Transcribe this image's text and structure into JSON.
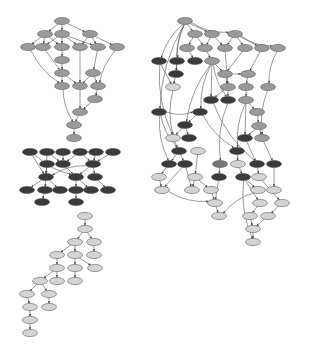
{
  "diagram": {
    "type": "directed-graph",
    "colors": {
      "medium": "#9a9a9a",
      "dark": "#3a3a3a",
      "light": "#d4d4d4",
      "mid2": "#777777",
      "edge": "#555555",
      "stroke": "#444444"
    },
    "node_rx": 7.5,
    "node_ry": 3.6,
    "clusters": [
      {
        "name": "left-top-medium",
        "color": "medium",
        "nodes": [
          [
            62,
            21
          ],
          [
            45,
            34
          ],
          [
            62,
            34
          ],
          [
            90,
            34
          ],
          [
            28,
            47
          ],
          [
            43,
            47
          ],
          [
            62,
            47
          ],
          [
            80,
            47
          ],
          [
            98,
            47
          ],
          [
            117,
            47
          ],
          [
            62,
            60
          ],
          [
            62,
            73
          ],
          [
            93,
            73
          ],
          [
            62,
            86
          ],
          [
            80,
            86
          ],
          [
            98,
            86
          ],
          [
            95,
            99
          ],
          [
            80,
            112
          ],
          [
            74,
            125
          ],
          [
            74,
            138
          ]
        ],
        "edges": [
          [
            0,
            1
          ],
          [
            0,
            2
          ],
          [
            0,
            3
          ],
          [
            1,
            4
          ],
          [
            1,
            5
          ],
          [
            1,
            6
          ],
          [
            2,
            5
          ],
          [
            2,
            6
          ],
          [
            2,
            7
          ],
          [
            2,
            8
          ],
          [
            3,
            7
          ],
          [
            3,
            8
          ],
          [
            3,
            9
          ],
          [
            6,
            10
          ],
          [
            10,
            11
          ],
          [
            4,
            13
          ],
          [
            5,
            11
          ],
          [
            7,
            14
          ],
          [
            8,
            12
          ],
          [
            9,
            15
          ],
          [
            11,
            13
          ],
          [
            11,
            14
          ],
          [
            12,
            14
          ],
          [
            12,
            15
          ],
          [
            15,
            16
          ],
          [
            16,
            17
          ],
          [
            14,
            17
          ],
          [
            13,
            18
          ],
          [
            17,
            18
          ],
          [
            18,
            19
          ]
        ]
      },
      {
        "name": "left-middle-dark",
        "color": "dark",
        "nodes": [
          [
            30,
            152
          ],
          [
            47,
            152
          ],
          [
            63,
            152
          ],
          [
            80,
            152
          ],
          [
            96,
            152
          ],
          [
            113,
            152
          ],
          [
            47,
            164
          ],
          [
            63,
            164
          ],
          [
            93,
            164
          ],
          [
            46,
            177
          ],
          [
            76,
            177
          ],
          [
            95,
            177
          ],
          [
            27,
            190
          ],
          [
            45,
            190
          ],
          [
            60,
            190
          ],
          [
            76,
            190
          ],
          [
            91,
            190
          ],
          [
            108,
            190
          ],
          [
            42,
            202
          ],
          [
            76,
            202
          ]
        ],
        "edges": [
          [
            0,
            9
          ],
          [
            1,
            9
          ],
          [
            1,
            7
          ],
          [
            2,
            7
          ],
          [
            3,
            7
          ],
          [
            3,
            8
          ],
          [
            4,
            8
          ],
          [
            5,
            8
          ],
          [
            6,
            9
          ],
          [
            7,
            10
          ],
          [
            8,
            9
          ],
          [
            8,
            10
          ],
          [
            8,
            11
          ],
          [
            9,
            12
          ],
          [
            9,
            13
          ],
          [
            9,
            14
          ],
          [
            10,
            15
          ],
          [
            10,
            16
          ],
          [
            11,
            17
          ],
          [
            13,
            18
          ],
          [
            15,
            19
          ],
          [
            0,
            10
          ]
        ]
      },
      {
        "name": "left-bottom-light",
        "color": "light",
        "nodes": [
          [
            85,
            216
          ],
          [
            85,
            229
          ],
          [
            75,
            242
          ],
          [
            94,
            242
          ],
          [
            57,
            255
          ],
          [
            75,
            255
          ],
          [
            94,
            255
          ],
          [
            57,
            268
          ],
          [
            75,
            268
          ],
          [
            95,
            268
          ],
          [
            40,
            281
          ],
          [
            57,
            281
          ],
          [
            75,
            281
          ],
          [
            27,
            294
          ],
          [
            49,
            294
          ],
          [
            30,
            307
          ],
          [
            49,
            307
          ],
          [
            30,
            320
          ],
          [
            30,
            333
          ]
        ],
        "edges": [
          [
            0,
            1
          ],
          [
            1,
            2
          ],
          [
            1,
            3
          ],
          [
            2,
            4
          ],
          [
            2,
            5
          ],
          [
            3,
            6
          ],
          [
            4,
            7
          ],
          [
            5,
            8
          ],
          [
            5,
            9
          ],
          [
            7,
            10
          ],
          [
            7,
            11
          ],
          [
            8,
            12
          ],
          [
            10,
            13
          ],
          [
            10,
            14
          ],
          [
            13,
            15
          ],
          [
            14,
            16
          ],
          [
            15,
            17
          ],
          [
            17,
            18
          ]
        ]
      },
      {
        "name": "right-mixed",
        "color": "mixed",
        "nodes": [
          [
            185,
            21,
            "medium"
          ],
          [
            195,
            34,
            "medium"
          ],
          [
            212,
            34,
            "medium"
          ],
          [
            235,
            34,
            "medium"
          ],
          [
            187,
            48,
            "medium"
          ],
          [
            205,
            48,
            "medium"
          ],
          [
            225,
            48,
            "medium"
          ],
          [
            245,
            48,
            "medium"
          ],
          [
            262,
            48,
            "medium"
          ],
          [
            278,
            48,
            "medium"
          ],
          [
            159,
            61,
            "dark"
          ],
          [
            177,
            61,
            "dark"
          ],
          [
            195,
            61,
            "dark"
          ],
          [
            212,
            61,
            "medium"
          ],
          [
            176,
            74,
            "dark"
          ],
          [
            225,
            74,
            "medium"
          ],
          [
            248,
            74,
            "medium"
          ],
          [
            173,
            87,
            "light"
          ],
          [
            228,
            87,
            "medium"
          ],
          [
            246,
            87,
            "medium"
          ],
          [
            268,
            87,
            "medium"
          ],
          [
            211,
            100,
            "dark"
          ],
          [
            228,
            100,
            "dark"
          ],
          [
            246,
            100,
            "medium"
          ],
          [
            159,
            112,
            "dark"
          ],
          [
            200,
            112,
            "dark"
          ],
          [
            257,
            112,
            "medium"
          ],
          [
            185,
            125,
            "dark"
          ],
          [
            259,
            126,
            "medium"
          ],
          [
            173,
            138,
            "light"
          ],
          [
            189,
            138,
            "dark"
          ],
          [
            245,
            138,
            "dark"
          ],
          [
            262,
            138,
            "medium"
          ],
          [
            179,
            151,
            "dark"
          ],
          [
            198,
            151,
            "light"
          ],
          [
            237,
            151,
            "dark"
          ],
          [
            169,
            164,
            "dark"
          ],
          [
            185,
            164,
            "dark"
          ],
          [
            220,
            164,
            "mid2"
          ],
          [
            238,
            164,
            "light"
          ],
          [
            257,
            164,
            "dark"
          ],
          [
            274,
            164,
            "dark"
          ],
          [
            159,
            177,
            "light"
          ],
          [
            195,
            177,
            "light"
          ],
          [
            219,
            177,
            "dark"
          ],
          [
            243,
            177,
            "dark"
          ],
          [
            259,
            177,
            "light"
          ],
          [
            162,
            190,
            "light"
          ],
          [
            192,
            190,
            "light"
          ],
          [
            211,
            190,
            "light"
          ],
          [
            258,
            190,
            "light"
          ],
          [
            274,
            190,
            "light"
          ],
          [
            215,
            203,
            "light"
          ],
          [
            260,
            203,
            "light"
          ],
          [
            282,
            203,
            "light"
          ],
          [
            219,
            216,
            "light"
          ],
          [
            250,
            216,
            "light"
          ],
          [
            268,
            216,
            "light"
          ],
          [
            253,
            229,
            "light"
          ],
          [
            253,
            242,
            "light"
          ]
        ],
        "edges": [
          [
            0,
            1
          ],
          [
            0,
            2
          ],
          [
            0,
            3
          ],
          [
            0,
            10
          ],
          [
            0,
            11
          ],
          [
            0,
            14
          ],
          [
            0,
            24
          ],
          [
            1,
            4
          ],
          [
            1,
            5
          ],
          [
            2,
            5
          ],
          [
            2,
            6
          ],
          [
            3,
            6
          ],
          [
            3,
            7
          ],
          [
            3,
            8
          ],
          [
            3,
            9
          ],
          [
            4,
            12
          ],
          [
            5,
            13
          ],
          [
            6,
            18
          ],
          [
            7,
            15
          ],
          [
            8,
            16
          ],
          [
            9,
            20
          ],
          [
            10,
            17
          ],
          [
            11,
            14
          ],
          [
            13,
            15
          ],
          [
            13,
            21
          ],
          [
            13,
            22
          ],
          [
            13,
            27
          ],
          [
            13,
            25
          ],
          [
            14,
            17
          ],
          [
            15,
            18
          ],
          [
            16,
            19
          ],
          [
            15,
            16
          ],
          [
            18,
            21
          ],
          [
            18,
            22
          ],
          [
            19,
            23
          ],
          [
            20,
            32
          ],
          [
            23,
            26
          ],
          [
            23,
            31
          ],
          [
            23,
            35
          ],
          [
            24,
            33
          ],
          [
            24,
            25
          ],
          [
            25,
            27
          ],
          [
            25,
            35
          ],
          [
            26,
            28
          ],
          [
            27,
            29
          ],
          [
            27,
            30
          ],
          [
            28,
            31
          ],
          [
            28,
            32
          ],
          [
            29,
            33
          ],
          [
            31,
            40
          ],
          [
            32,
            41
          ],
          [
            33,
            36
          ],
          [
            33,
            37
          ],
          [
            34,
            43
          ],
          [
            35,
            39
          ],
          [
            36,
            42
          ],
          [
            37,
            47
          ],
          [
            37,
            48
          ],
          [
            38,
            44
          ],
          [
            39,
            45
          ],
          [
            40,
            46
          ],
          [
            41,
            51
          ],
          [
            42,
            47
          ],
          [
            43,
            48
          ],
          [
            43,
            49
          ],
          [
            44,
            52
          ],
          [
            45,
            50
          ],
          [
            45,
            53
          ],
          [
            46,
            54
          ],
          [
            47,
            52
          ],
          [
            49,
            52
          ],
          [
            50,
            55
          ],
          [
            52,
            55
          ],
          [
            53,
            56
          ],
          [
            54,
            57
          ],
          [
            56,
            58
          ],
          [
            57,
            58
          ],
          [
            58,
            59
          ],
          [
            45,
            59
          ],
          [
            24,
            36
          ],
          [
            10,
            29
          ],
          [
            17,
            29
          ],
          [
            21,
            40
          ],
          [
            22,
            38
          ]
        ]
      }
    ]
  }
}
